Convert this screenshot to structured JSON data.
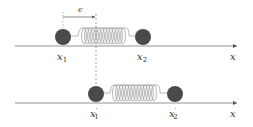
{
  "diagram": {
    "colors": {
      "ball": "#4a4a4a",
      "axis": "#777777",
      "spring": "#888888",
      "dash": "#777777",
      "text": "#333333"
    },
    "top_row": {
      "mass1_label": "x",
      "mass1_sub": "1",
      "mass2_label": "x",
      "mass2_sub": "2",
      "axis_label": "x",
      "displacement_label": "ϵ"
    },
    "bottom_row": {
      "mass1_label": "x",
      "mass1_sub": "1",
      "mass1_prime": "′",
      "mass2_label": "x",
      "mass2_sub": "2",
      "mass2_prime": "′",
      "axis_label": "x"
    }
  }
}
